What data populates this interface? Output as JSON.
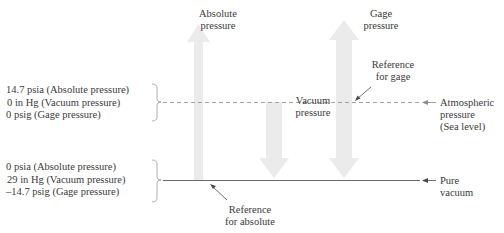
{
  "diagram": {
    "top_labels": {
      "absolute_pressure": [
        "Absolute",
        "pressure"
      ],
      "gage_pressure": [
        "Gage",
        "pressure"
      ],
      "vacuum_pressure": [
        "Vacuum",
        "pressure"
      ]
    },
    "reference_labels": {
      "reference_for_gage": [
        "Reference",
        "for gage"
      ],
      "reference_for_absolute": [
        "Reference",
        "for absolute"
      ]
    },
    "atmospheric_group": {
      "lines": [
        "14.7 psia (Absolute pressure)",
        "0 in Hg (Vacuum pressure)",
        "0 psig (Gage pressure)"
      ]
    },
    "vacuum_group": {
      "lines": [
        "0 psia (Absolute pressure)",
        "29 in Hg (Vacuum pressure)",
        "–14.7 psig (Gage pressure)"
      ]
    },
    "right_labels": {
      "atmospheric": [
        "Atmospheric",
        "pressure",
        "(Sea level)"
      ],
      "pure_vacuum": [
        "Pure",
        "vacuum"
      ]
    },
    "colors": {
      "arrow_fill": "#ebebeb",
      "line_dashed": "#9a9a9a",
      "line_solid": "#6a6a6a",
      "text": "#3a3a3a"
    }
  }
}
